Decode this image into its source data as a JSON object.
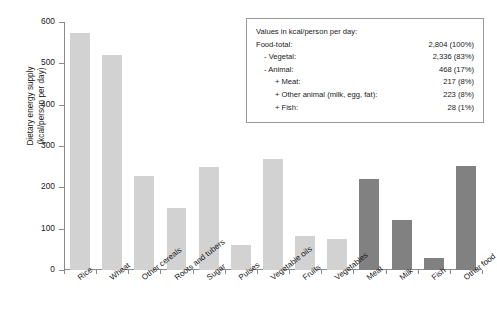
{
  "chart_data": {
    "type": "bar",
    "title": "",
    "xlabel": "",
    "ylabel": "Dietary energy supply\n(kcal/person per day)",
    "ylim": [
      0,
      600
    ],
    "yticks": [
      0,
      100,
      200,
      300,
      400,
      500,
      600
    ],
    "grid": false,
    "legend_position": "none",
    "categories": [
      "Rice",
      "Wheat",
      "Other cereals",
      "Roots and tubers",
      "Sugar",
      "Pulses",
      "Vegetable oils",
      "Fruits",
      "Vegetables",
      "Meat",
      "Milk",
      "Fish",
      "Other food"
    ],
    "values": [
      573,
      521,
      228,
      150,
      249,
      61,
      268,
      82,
      76,
      219,
      122,
      29,
      252
    ],
    "bar_colors": [
      "#d2d2d2",
      "#d2d2d2",
      "#d2d2d2",
      "#d2d2d2",
      "#d2d2d2",
      "#d2d2d2",
      "#d2d2d2",
      "#d2d2d2",
      "#d2d2d2",
      "#818181",
      "#818181",
      "#818181",
      "#818181"
    ]
  },
  "colors": {
    "vegetal_bar": "#d2d2d2",
    "animal_bar": "#818181",
    "axis": "#8a8a8a",
    "text": "#1a1a1a",
    "box_border": "#9a9a9a"
  },
  "info_box": {
    "heading": "Values in kcal/person per day:",
    "rows": [
      {
        "label": "Food-total:",
        "value": "2,804 (100%)"
      },
      {
        "label": "- Vegetal:",
        "value": "2,336  (83%)"
      },
      {
        "label": "- Animal:",
        "value": "468  (17%)"
      },
      {
        "label": "+ Meat:",
        "value": "217 (8%)"
      },
      {
        "label": "+ Other animal (milk, egg, fat):",
        "value": "223 (8%)"
      },
      {
        "label": "+ Fish:",
        "value": "28 (1%)"
      }
    ]
  }
}
